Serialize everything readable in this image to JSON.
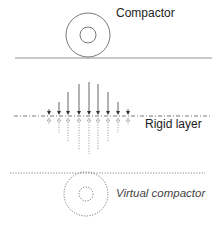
{
  "labels": {
    "compactor": "Compactor",
    "rigid_layer": "Rigid layer",
    "virtual_compactor": "Virtual compactor"
  },
  "arrows": [
    {
      "x": 49,
      "top": 109,
      "bottom": 125
    },
    {
      "x": 59,
      "top": 102,
      "bottom": 133
    },
    {
      "x": 68,
      "top": 92,
      "bottom": 141
    },
    {
      "x": 79,
      "top": 84,
      "bottom": 150
    },
    {
      "x": 89,
      "top": 82,
      "bottom": 154
    },
    {
      "x": 98,
      "top": 84,
      "bottom": 150
    },
    {
      "x": 108,
      "top": 92,
      "bottom": 141
    },
    {
      "x": 118,
      "top": 102,
      "bottom": 133
    },
    {
      "x": 128,
      "top": 109,
      "bottom": 125
    }
  ],
  "colors": {
    "line": "#555555",
    "text": "#222222"
  }
}
